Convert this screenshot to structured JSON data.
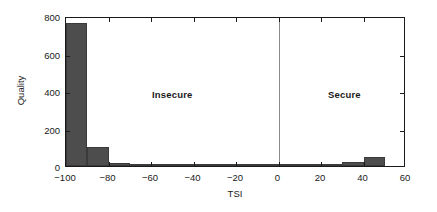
{
  "chart_data": {
    "type": "bar",
    "title": "",
    "subtitle": "",
    "xlabel": "TSI",
    "ylabel": "Quality",
    "xlim": [
      -100,
      60
    ],
    "ylim": [
      0,
      800
    ],
    "xticks": [
      -100,
      -80,
      -60,
      -40,
      -20,
      0,
      20,
      40,
      60
    ],
    "xticklabels": [
      "−100",
      "−80",
      "−60",
      "−40",
      "−20",
      "0",
      "20",
      "40",
      "60"
    ],
    "yticks": [
      0,
      200,
      400,
      600,
      800
    ],
    "yticklabels": [
      "0",
      "200",
      "400",
      "600",
      "800"
    ],
    "grid": false,
    "legend": null,
    "bin_width": 10,
    "bar_color": "#4d4d4d",
    "bar_edge_color": "#3a3a3a",
    "axis_color": "#1a1a1a",
    "divider_color": "#8c8c8c",
    "bins": [
      {
        "x0": -100,
        "x1": -90,
        "center": -95,
        "value": 765
      },
      {
        "x0": -90,
        "x1": -80,
        "center": -85,
        "value": 100
      },
      {
        "x0": -80,
        "x1": -70,
        "center": -75,
        "value": 18
      },
      {
        "x0": -70,
        "x1": -60,
        "center": -65,
        "value": 8
      },
      {
        "x0": -60,
        "x1": -50,
        "center": -55,
        "value": 5
      },
      {
        "x0": -50,
        "x1": -40,
        "center": -45,
        "value": 4
      },
      {
        "x0": -40,
        "x1": -30,
        "center": -35,
        "value": 4
      },
      {
        "x0": -30,
        "x1": -20,
        "center": -25,
        "value": 3
      },
      {
        "x0": -20,
        "x1": -10,
        "center": -15,
        "value": 6
      },
      {
        "x0": -10,
        "x1": 0,
        "center": -5,
        "value": 3
      },
      {
        "x0": 0,
        "x1": 10,
        "center": 5,
        "value": 3
      },
      {
        "x0": 10,
        "x1": 20,
        "center": 15,
        "value": 4
      },
      {
        "x0": 20,
        "x1": 30,
        "center": 25,
        "value": 5
      },
      {
        "x0": 30,
        "x1": 40,
        "center": 35,
        "value": 22
      },
      {
        "x0": 40,
        "x1": 50,
        "center": 45,
        "value": 50
      },
      {
        "x0": 50,
        "x1": 60,
        "center": 55,
        "value": 0
      }
    ],
    "annotations": [
      {
        "name": "insecure",
        "text": "Insecure",
        "x": -50,
        "y": 420
      },
      {
        "name": "secure",
        "text": "Secure",
        "x": 31,
        "y": 420
      }
    ],
    "reference_lines": [
      {
        "name": "security-threshold",
        "x": 0,
        "orientation": "vertical"
      }
    ]
  }
}
